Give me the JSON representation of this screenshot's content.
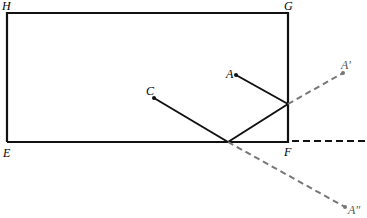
{
  "diagram": {
    "colors": {
      "solid": "#111111",
      "dashed": "#777777",
      "background": "#ffffff"
    },
    "rectangle": {
      "corners": {
        "H": {
          "x": 7,
          "y": 13
        },
        "G": {
          "x": 288,
          "y": 13
        },
        "F": {
          "x": 288,
          "y": 142
        },
        "E": {
          "x": 7,
          "y": 142
        }
      }
    },
    "points": {
      "A": {
        "x": 236,
        "y": 75
      },
      "C": {
        "x": 154,
        "y": 98
      },
      "P1": {
        "x": 288,
        "y": 104
      },
      "P2": {
        "x": 228,
        "y": 142
      },
      "A_prime": {
        "x": 343,
        "y": 73
      },
      "A_double_prime": {
        "x": 345,
        "y": 207
      }
    },
    "labels": {
      "H": "H",
      "G": "G",
      "E": "E",
      "F": "F",
      "A": "A",
      "C": "C",
      "A_prime": "A′",
      "A_double_prime": "A″"
    }
  }
}
